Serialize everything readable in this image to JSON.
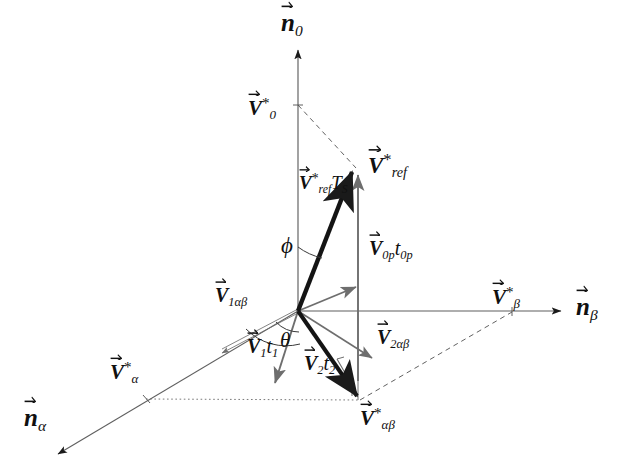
{
  "figure": {
    "background_color": "#ffffff",
    "stroke_dark": "#1a1a1a",
    "stroke_gray": "#6e6e6e",
    "stroke_dashed": "#555555",
    "width": 624,
    "height": 475
  },
  "axes": [
    {
      "id": "n0",
      "name": "n-zero-axis",
      "label_base": "n",
      "label_sub": "0",
      "label_sup": "",
      "label_x": 288,
      "label_y": 12,
      "direction": "vertical-up",
      "from": [
        298,
        310
      ],
      "to": [
        298,
        48
      ]
    },
    {
      "id": "nbeta",
      "name": "n-beta-axis",
      "label_base": "n",
      "label_sub": "β",
      "label_sup": "",
      "label_x": 578,
      "label_y": 297,
      "direction": "horizontal-right",
      "from": [
        298,
        311
      ],
      "to": [
        563,
        311
      ]
    },
    {
      "id": "nalpha",
      "name": "n-alpha-axis",
      "label_base": "n",
      "label_sub": "α",
      "label_sup": "",
      "label_x": 26,
      "label_y": 408,
      "direction": "oblique-down-left",
      "from": [
        298,
        311
      ],
      "to": [
        56,
        455
      ]
    }
  ],
  "axis_ticks": [
    {
      "id": "V0",
      "name": "v-star-zero-tick",
      "label_base": "V",
      "label_sub": "0",
      "label_sup": "*",
      "label_x": 246,
      "label_y": 99,
      "point": [
        298,
        105
      ]
    },
    {
      "id": "Vbeta",
      "name": "v-star-beta-tick",
      "label_base": "V",
      "label_sub": "β",
      "label_sup": "*",
      "label_x": 492,
      "label_y": 288,
      "point": [
        512,
        312
      ]
    },
    {
      "id": "Valpha",
      "name": "v-star-alpha-tick",
      "label_base": "V",
      "label_sub": "α",
      "label_sup": "*",
      "label_x": 108,
      "label_y": 363,
      "point": [
        146,
        399
      ]
    }
  ],
  "vectors": [
    {
      "id": "Vref_Ts",
      "name": "v-ref-ts-vector",
      "label_base": "V",
      "label_sub": "ref",
      "label_sup": "*",
      "label_suffix": "T",
      "label_suffix_sub": "S",
      "label_x": 300,
      "label_y": 176,
      "from": [
        298,
        310
      ],
      "to": [
        357,
        165
      ],
      "style": "thick-dark"
    },
    {
      "id": "Vref",
      "name": "v-star-ref-label",
      "label_base": "V",
      "label_sub": "ref",
      "label_sup": "*",
      "label_x": 372,
      "label_y": 156
    },
    {
      "id": "V0p_t0p",
      "name": "v-zero-p-t-zero-p-vector",
      "label_base": "V",
      "label_sub": "0p",
      "label_suffix": "t",
      "label_suffix_sub": "0p",
      "label_x": 370,
      "label_y": 240,
      "from": [
        358,
        380
      ],
      "to": [
        358,
        172
      ],
      "style": "gray"
    },
    {
      "id": "V1_alpha_beta",
      "name": "v-one-alpha-beta-vector",
      "label_base": "V",
      "label_sub": "1αβ",
      "label_x": 216,
      "label_y": 288,
      "from": [
        298,
        311
      ],
      "to": [
        219,
        352
      ],
      "style": "double-thin-gray"
    },
    {
      "id": "V1_t1",
      "name": "v-one-t-one-vector",
      "label_base": "V",
      "label_sub": "1",
      "label_suffix": "t",
      "label_suffix_sub": "1",
      "label_x": 248,
      "label_y": 338,
      "from": [
        298,
        311
      ],
      "to": [
        274,
        385
      ],
      "style": "gray"
    },
    {
      "id": "V2_alpha_beta",
      "name": "v-two-alpha-beta-vector",
      "label_base": "V",
      "label_sub": "2αβ",
      "label_x": 378,
      "label_y": 330,
      "from": [
        298,
        311
      ],
      "to": [
        375,
        360
      ],
      "style": "gray"
    },
    {
      "id": "V2_t2",
      "name": "v-two-t-two-vector",
      "label_base": "V",
      "label_sub": "2",
      "label_suffix": "t",
      "label_suffix_sub": "2",
      "label_x": 305,
      "label_y": 355,
      "from": [
        298,
        311
      ],
      "to": [
        359,
        400
      ],
      "style": "thick-dark"
    },
    {
      "id": "Valphabeta",
      "name": "v-star-alpha-beta-label",
      "label_base": "V",
      "label_sub": "αβ",
      "label_sup": "*",
      "label_x": 362,
      "label_y": 408,
      "point": [
        359,
        400
      ]
    },
    {
      "id": "V_diag_up",
      "name": "origin-to-vref-projection-vector",
      "from": [
        298,
        311
      ],
      "to": [
        358,
        287
      ],
      "style": "gray"
    }
  ],
  "angles": [
    {
      "id": "phi",
      "name": "phi-angle-label",
      "symbol": "ϕ",
      "label_x": 284,
      "label_y": 237,
      "between": [
        "n0-axis",
        "Vref_Ts"
      ]
    },
    {
      "id": "theta",
      "name": "theta-angle-label",
      "symbol": "θ",
      "label_x": 282,
      "label_y": 334,
      "between": [
        "V1_alpha_beta",
        "V2_alpha_beta"
      ]
    }
  ],
  "dashed_lines": [
    {
      "name": "v0-to-vref-dashed",
      "from": [
        298,
        105
      ],
      "to": [
        357,
        167
      ]
    },
    {
      "name": "valphabeta-to-vbeta-dashed",
      "from": [
        359,
        400
      ],
      "to": [
        512,
        312
      ]
    },
    {
      "name": "valpha-to-valphabeta-dotted",
      "from": [
        146,
        399
      ],
      "to": [
        359,
        400
      ]
    }
  ]
}
